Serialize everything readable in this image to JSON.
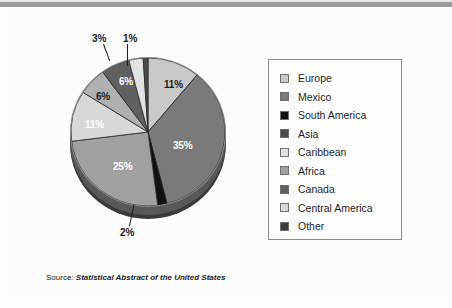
{
  "page": {
    "background": "#fdfdfd",
    "top_bar_color": "#9b9b9b",
    "bottom_rule_color": "#d2d2d2"
  },
  "chart_data": {
    "type": "pie",
    "title": "",
    "subtitle": "",
    "xlabel": "",
    "ylabel": "",
    "legend_position": "right",
    "grid": false,
    "categories": [
      "Europe",
      "Mexico",
      "South America",
      "Asia",
      "Caribbean",
      "Africa",
      "Canada",
      "Central America",
      "Other"
    ],
    "values": [
      11,
      35,
      2,
      25,
      11,
      6,
      6,
      3,
      1
    ],
    "value_labels": [
      "11%",
      "35%",
      "2%",
      "25%",
      "11%",
      "6%",
      "6%",
      "3%",
      "1%"
    ],
    "colors": [
      "#c9c9c9",
      "#7a7a7a",
      "#111111",
      "#a0a0a0",
      "#d8d8d8",
      "#b0b0b0",
      "#606060",
      "#e2e2e2",
      "#4a4a4a"
    ],
    "units": "percent",
    "annotations": [
      "3%",
      "1%",
      "2%"
    ]
  },
  "legend": {
    "items": [
      {
        "label": "Europe",
        "color": "#c9c9c9"
      },
      {
        "label": "Mexico",
        "color": "#7a7a7a"
      },
      {
        "label": "South America",
        "color": "#111111"
      },
      {
        "label": "Asia",
        "color": "#4d4d4d"
      },
      {
        "label": "Caribbean",
        "color": "#e2e2e2"
      },
      {
        "label": "Africa",
        "color": "#a0a0a0"
      },
      {
        "label": "Canada",
        "color": "#606060"
      },
      {
        "label": "Central America",
        "color": "#d8d8d8"
      },
      {
        "label": "Other",
        "color": "#3b3b3b"
      }
    ]
  },
  "pie_labels": [
    {
      "text": "11%",
      "tone": "dark"
    },
    {
      "text": "35%",
      "tone": "light"
    },
    {
      "text": "25%",
      "tone": "light"
    },
    {
      "text": "11%",
      "tone": "light"
    },
    {
      "text": "6%",
      "tone": "dark"
    },
    {
      "text": "6%",
      "tone": "light"
    }
  ],
  "callouts": [
    {
      "text": "3%"
    },
    {
      "text": "1%"
    },
    {
      "text": "2%"
    }
  ],
  "source": {
    "prefix": "Source:",
    "title": "Statistical Abstract of the United States"
  }
}
